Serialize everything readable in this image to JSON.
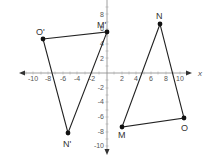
{
  "diagram": {
    "type": "coordinate-plane",
    "x_axis_label": "x",
    "x_ticks": [
      "-10",
      "-8",
      "-6",
      "-4",
      "-2",
      "2",
      "4",
      "6",
      "8",
      "10"
    ],
    "y_ticks": [
      "8",
      "6",
      "4",
      "2",
      "-2",
      "-4",
      "-6",
      "-8",
      "-10"
    ],
    "colors": {
      "axis": "#777777",
      "shape": "#222222",
      "point": "#111111",
      "label": "#333333"
    },
    "triangles": [
      {
        "name": "triangle-primed",
        "vertices": [
          {
            "label": "O'",
            "x": -9,
            "y": 5
          },
          {
            "label": "M'",
            "x": 0,
            "y": 6
          },
          {
            "label": "N'",
            "x": -6,
            "y": -8
          }
        ]
      },
      {
        "name": "triangle-original",
        "vertices": [
          {
            "label": "N",
            "x": 7,
            "y": 7
          },
          {
            "label": "M",
            "x": 2,
            "y": -7
          },
          {
            "label": "O",
            "x": 11,
            "y": -6
          }
        ]
      }
    ]
  },
  "labels": {
    "O_prime": "O'",
    "M_prime": "M'",
    "N_prime": "N'",
    "N": "N",
    "M": "M",
    "O": "O",
    "x": "x"
  },
  "ticks": {
    "xm10": "-10",
    "xm8": "-8",
    "xm6": "-6",
    "xm4": "-4",
    "xm2": "-2",
    "x2": "2",
    "x4": "4",
    "x6": "6",
    "x8": "8",
    "x10": "10",
    "y8": "8",
    "y6": "6",
    "y4": "4",
    "y2": "2",
    "ym2": "-2",
    "ym4": "-4",
    "ym6": "-6",
    "ym8": "-8",
    "ym10": "-10"
  }
}
